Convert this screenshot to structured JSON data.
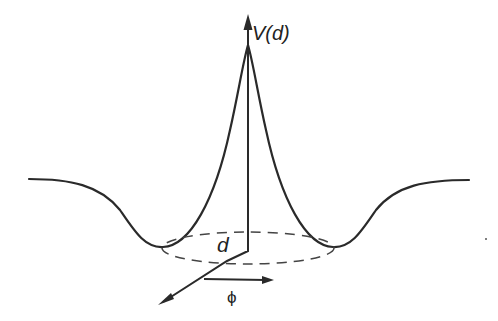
{
  "diagram": {
    "labels": {
      "vertical_axis": "V(d)",
      "radial": "d",
      "angle": "ϕ"
    },
    "colors": {
      "stroke": "#2a2a2a",
      "background": "#ffffff"
    }
  }
}
